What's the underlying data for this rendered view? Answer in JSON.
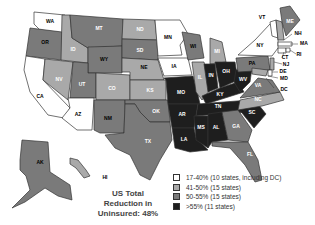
{
  "title_lines": [
    "US Total",
    "Reduction in",
    "Uninsured: 48%"
  ],
  "colors": {
    "c1": "#ffffff",
    "c2": "#a9a9a9",
    "c3": "#7a7a7a",
    "c4": "#1e1e1e"
  },
  "legend": [
    {
      "label": "17-40% (10 states, including DC)",
      "color": "#ffffff"
    },
    {
      "label": "41-50% (15 states)",
      "color": "#a9a9a9"
    },
    {
      "label": "50-55% (15 states)",
      "color": "#7a7a7a"
    },
    {
      "label": ">55% (11 states)",
      "color": "#1e1e1e"
    }
  ],
  "states": {
    "WA": "WA",
    "OR": "OR",
    "CA": "CA",
    "ID": "ID",
    "NV": "NV",
    "MT": "MT",
    "WY": "WY",
    "UT": "UT",
    "AZ": "AZ",
    "CO": "CO",
    "NM": "NM",
    "ND": "ND",
    "SD": "SD",
    "NE": "NE",
    "KS": "KS",
    "OK": "OK",
    "TX": "TX",
    "MN": "MN",
    "IA": "IA",
    "MO": "MO",
    "AR": "AR",
    "LA": "LA",
    "WI": "WI",
    "IL": "IL",
    "MI": "MI",
    "IN": "IN",
    "OH": "OH",
    "KY": "KY",
    "TN": "TN",
    "MS": "MS",
    "AL": "AL",
    "GA": "GA",
    "FL": "FL",
    "SC": "SC",
    "NC": "NC",
    "VA": "VA",
    "WV": "WV",
    "PA": "PA",
    "NY": "NY",
    "VT": "VT",
    "NH": "NH",
    "ME": "ME",
    "MA": "MA",
    "RI": "RI",
    "CT": "CT",
    "NJ": "NJ",
    "DE": "DE",
    "MD": "MD",
    "DC": "DC",
    "AK": "AK",
    "HI": "HI"
  }
}
